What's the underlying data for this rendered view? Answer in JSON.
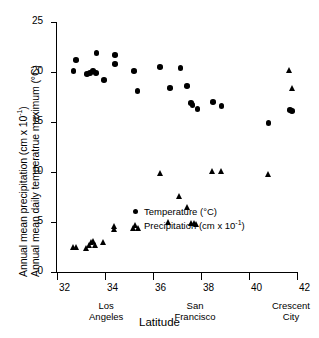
{
  "chart_data": {
    "type": "scatter",
    "title": "",
    "xlabel": "Latitude",
    "ylabel_line1": "Annual mean precipitation (cm  x 10-1)",
    "ylabel_line2": "Annual mean daily temperatrue maximum (°C)",
    "xlim": [
      32,
      42
    ],
    "ylim": [
      0,
      25
    ],
    "xticks": [
      "32",
      "34",
      "36",
      "38",
      "40",
      "42"
    ],
    "xtick_values": [
      32,
      34,
      36,
      38,
      40,
      42
    ],
    "yticks": [
      "0",
      "5",
      "10",
      "15",
      "20",
      "25"
    ],
    "ytick_values": [
      0,
      5,
      10,
      15,
      20,
      25
    ],
    "grid": false,
    "legend_position": "lower-center-right",
    "annotations": [
      {
        "label_line1": "Los",
        "label_line2": "Angeles",
        "x": 34.05
      },
      {
        "label_line1": "San",
        "label_line2": "Francisco",
        "x": 37.75
      },
      {
        "label_line1": "Crescent",
        "label_line2": "City",
        "x": 41.75
      }
    ],
    "series": [
      {
        "name": "Temperature (°C)",
        "marker": "circle",
        "color": "#000000",
        "points": [
          {
            "x": 32.68,
            "y": 20.1
          },
          {
            "x": 32.78,
            "y": 21.2
          },
          {
            "x": 33.25,
            "y": 19.8
          },
          {
            "x": 33.38,
            "y": 19.9
          },
          {
            "x": 33.5,
            "y": 20.1
          },
          {
            "x": 33.62,
            "y": 19.9
          },
          {
            "x": 33.65,
            "y": 21.9
          },
          {
            "x": 33.95,
            "y": 19.2
          },
          {
            "x": 34.42,
            "y": 21.7
          },
          {
            "x": 34.42,
            "y": 20.8
          },
          {
            "x": 35.22,
            "y": 20.1
          },
          {
            "x": 35.35,
            "y": 18.1
          },
          {
            "x": 36.3,
            "y": 20.5
          },
          {
            "x": 36.7,
            "y": 18.4
          },
          {
            "x": 37.15,
            "y": 20.4
          },
          {
            "x": 37.42,
            "y": 18.6
          },
          {
            "x": 37.58,
            "y": 16.9
          },
          {
            "x": 37.65,
            "y": 16.7
          },
          {
            "x": 37.85,
            "y": 16.3
          },
          {
            "x": 38.5,
            "y": 17.0
          },
          {
            "x": 38.85,
            "y": 16.6
          },
          {
            "x": 40.82,
            "y": 14.9
          },
          {
            "x": 41.72,
            "y": 16.2
          },
          {
            "x": 41.8,
            "y": 16.1
          }
        ]
      },
      {
        "name": "Precipitation (cm  x 10-1)",
        "marker": "triangle",
        "color": "#000000",
        "points": [
          {
            "x": 32.7,
            "y": 2.5
          },
          {
            "x": 32.8,
            "y": 2.5
          },
          {
            "x": 33.25,
            "y": 2.4
          },
          {
            "x": 33.35,
            "y": 2.7
          },
          {
            "x": 33.45,
            "y": 3.0
          },
          {
            "x": 33.52,
            "y": 3.1
          },
          {
            "x": 33.6,
            "y": 2.7
          },
          {
            "x": 33.95,
            "y": 3.0
          },
          {
            "x": 34.4,
            "y": 4.3
          },
          {
            "x": 34.42,
            "y": 4.6
          },
          {
            "x": 35.2,
            "y": 4.4
          },
          {
            "x": 35.38,
            "y": 4.4
          },
          {
            "x": 36.3,
            "y": 9.9
          },
          {
            "x": 36.65,
            "y": 5.0
          },
          {
            "x": 37.1,
            "y": 7.6
          },
          {
            "x": 37.45,
            "y": 6.5
          },
          {
            "x": 37.62,
            "y": 4.9
          },
          {
            "x": 37.72,
            "y": 4.9
          },
          {
            "x": 37.8,
            "y": 4.8
          },
          {
            "x": 38.5,
            "y": 10.1
          },
          {
            "x": 38.85,
            "y": 10.1
          },
          {
            "x": 40.8,
            "y": 9.8
          },
          {
            "x": 41.7,
            "y": 20.2
          },
          {
            "x": 41.8,
            "y": 18.4
          }
        ]
      }
    ]
  }
}
